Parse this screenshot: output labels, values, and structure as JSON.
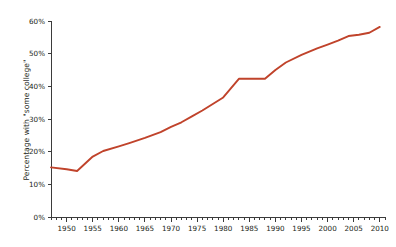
{
  "chart_data": {
    "type": "line",
    "title": "",
    "subtitle": "",
    "xlabel": "",
    "ylabel": "Percentage with \"some college\"",
    "xlim": [
      1947,
      2011
    ],
    "ylim": [
      0,
      60
    ],
    "grid": false,
    "legend": null,
    "legend_position": "none",
    "series_color": "#C0432B",
    "axis_color": "#3b3b3b",
    "x_tick_labels": [
      "1950",
      "1955",
      "1960",
      "1965",
      "1970",
      "1975",
      "1980",
      "1985",
      "1990",
      "1995",
      "2000",
      "2005",
      "2010"
    ],
    "x_tick_values": [
      1950,
      1955,
      1960,
      1965,
      1970,
      1975,
      1980,
      1985,
      1990,
      1995,
      2000,
      2005,
      2010
    ],
    "x_minor_tick_step": 1,
    "y_tick_labels": [
      "0%",
      "10%",
      "20%",
      "30%",
      "40%",
      "50%",
      "60%"
    ],
    "y_tick_values": [
      0,
      10,
      20,
      30,
      40,
      50,
      60
    ],
    "series": [
      {
        "name": "Percentage with \"some college\"",
        "x": [
          1947,
          1950,
          1952,
          1955,
          1957,
          1960,
          1962,
          1965,
          1968,
          1970,
          1972,
          1974,
          1976,
          1978,
          1980,
          1983,
          1985,
          1988,
          1990,
          1992,
          1995,
          1998,
          2000,
          2002,
          2004,
          2006,
          2008,
          2010
        ],
        "values": [
          15.2,
          14.6,
          14.1,
          18.5,
          20.2,
          21.6,
          22.6,
          24.2,
          26.0,
          27.6,
          29.0,
          30.8,
          32.6,
          34.6,
          36.6,
          42.3,
          42.3,
          42.3,
          45.0,
          47.3,
          49.6,
          51.6,
          52.8,
          54.0,
          55.4,
          55.8,
          56.4,
          58.2
        ]
      }
    ],
    "annotations": [
      {
        "label": "plateau",
        "x_range": [
          1983,
          1988
        ],
        "value": 42.3
      }
    ]
  }
}
